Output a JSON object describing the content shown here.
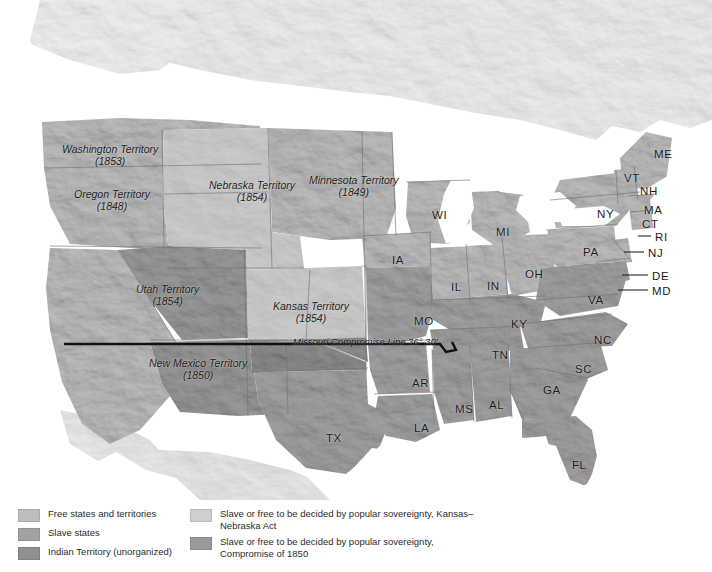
{
  "map": {
    "title": "United States 1854 — Slavery and Territorial Expansion",
    "colors": {
      "free": "#bdbdbd",
      "slave": "#a2a2a2",
      "indian": "#8f8f8f",
      "kansas_nebraska": "#cfcfcf",
      "compromise_1850": "#9a9a9a",
      "water": "#ffffff",
      "unshaded_land": "#eeeeee",
      "border": "#6d6d6d",
      "mc_line": "#111111"
    },
    "territories": [
      {
        "name": "Washington Territory",
        "year": "(1853)",
        "x": 62,
        "y": 143,
        "fill": "free"
      },
      {
        "name": "Oregon Territory",
        "year": "(1848)",
        "x": 74,
        "y": 188,
        "fill": "free"
      },
      {
        "name": "Utah Territory",
        "year": "(1854)",
        "x": 136,
        "y": 283,
        "fill": "compromise_1850"
      },
      {
        "name": "New Mexico Territory",
        "year": "(1850)",
        "x": 149,
        "y": 357,
        "fill": "compromise_1850"
      },
      {
        "name": "Nebraska Territory",
        "year": "(1854)",
        "x": 209,
        "y": 179,
        "fill": "kansas_nebraska"
      },
      {
        "name": "Minnesota Territory",
        "year": "(1849)",
        "x": 309,
        "y": 174,
        "fill": "free"
      },
      {
        "name": "Kansas Territory",
        "year": "(1854)",
        "x": 273,
        "y": 300,
        "fill": "kansas_nebraska"
      }
    ],
    "annotation": {
      "missouri_compromise": "Missouri Compromise Line 36° 30'"
    },
    "states": [
      {
        "abbr": "ME",
        "x": 654,
        "y": 148
      },
      {
        "abbr": "VT",
        "x": 624,
        "y": 172
      },
      {
        "abbr": "NH",
        "x": 640,
        "y": 185
      },
      {
        "abbr": "MA",
        "x": 644,
        "y": 204
      },
      {
        "abbr": "CT",
        "x": 642,
        "y": 218
      },
      {
        "abbr": "RI",
        "x": 655,
        "y": 231
      },
      {
        "abbr": "NJ",
        "x": 648,
        "y": 247
      },
      {
        "abbr": "DE",
        "x": 652,
        "y": 270
      },
      {
        "abbr": "MD",
        "x": 652,
        "y": 285
      },
      {
        "abbr": "NY",
        "x": 597,
        "y": 208
      },
      {
        "abbr": "PA",
        "x": 583,
        "y": 246
      },
      {
        "abbr": "VA",
        "x": 588,
        "y": 294
      },
      {
        "abbr": "NC",
        "x": 594,
        "y": 334
      },
      {
        "abbr": "SC",
        "x": 575,
        "y": 363
      },
      {
        "abbr": "GA",
        "x": 543,
        "y": 384
      },
      {
        "abbr": "FL",
        "x": 572,
        "y": 459
      },
      {
        "abbr": "AL",
        "x": 489,
        "y": 399
      },
      {
        "abbr": "MS",
        "x": 455,
        "y": 403
      },
      {
        "abbr": "LA",
        "x": 414,
        "y": 422
      },
      {
        "abbr": "AR",
        "x": 412,
        "y": 377
      },
      {
        "abbr": "TX",
        "x": 326,
        "y": 432
      },
      {
        "abbr": "TN",
        "x": 492,
        "y": 349
      },
      {
        "abbr": "KY",
        "x": 511,
        "y": 318
      },
      {
        "abbr": "MO",
        "x": 414,
        "y": 315
      },
      {
        "abbr": "IA",
        "x": 392,
        "y": 254
      },
      {
        "abbr": "IL",
        "x": 451,
        "y": 281
      },
      {
        "abbr": "IN",
        "x": 487,
        "y": 280
      },
      {
        "abbr": "OH",
        "x": 525,
        "y": 268
      },
      {
        "abbr": "MI",
        "x": 496,
        "y": 226
      },
      {
        "abbr": "WI",
        "x": 432,
        "y": 209
      }
    ],
    "leader_lines": [
      {
        "name": "ri-leader",
        "x1": 640,
        "y1": 236,
        "x2": 651,
        "y2": 236
      },
      {
        "name": "nj-leader",
        "x1": 623,
        "y1": 252,
        "x2": 645,
        "y2": 252
      },
      {
        "name": "de-leader",
        "x1": 621,
        "y1": 275,
        "x2": 649,
        "y2": 275
      },
      {
        "name": "md-leader",
        "x1": 617,
        "y1": 290,
        "x2": 649,
        "y2": 290
      }
    ]
  },
  "legend": {
    "left_items": [
      {
        "label": "Free states and territories",
        "swatch": "free"
      },
      {
        "label": "Slave states",
        "swatch": "slave"
      },
      {
        "label": "Indian Territory (unorganized)",
        "swatch": "indian"
      }
    ],
    "right_items": [
      {
        "label": "Slave or free to be decided by popular sovereignty, Kansas–Nebraska Act",
        "swatch": "kansas_nebraska"
      },
      {
        "label": "Slave or free to be decided by popular sovereignty, Compromise of 1850",
        "swatch": "compromise_1850"
      }
    ]
  }
}
